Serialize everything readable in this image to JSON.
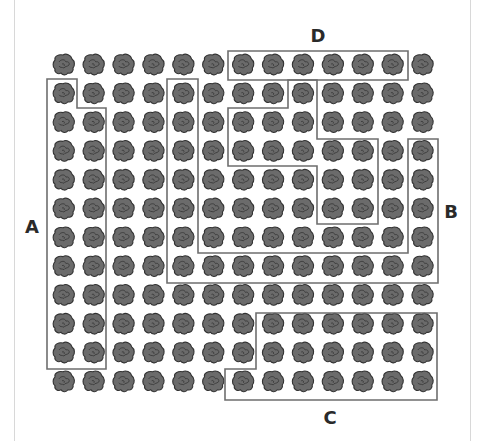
{
  "diagram": {
    "type": "grid-region-diagram",
    "grid": {
      "columns": 13,
      "rows": 12,
      "origin_x": 64,
      "origin_y": 65,
      "col_spacing": 29.9,
      "row_spacing": 28.8,
      "item_icon": "rock-blob-icon",
      "item_fill": "#6b6b6b",
      "item_stroke": "#333333"
    },
    "regions": [
      {
        "id": "A",
        "label": "A",
        "label_pos": [
          32,
          227
        ],
        "points": [
          [
            47,
            79
          ],
          [
            77,
            79
          ],
          [
            77,
            108
          ],
          [
            106,
            108
          ],
          [
            106,
            369
          ],
          [
            47,
            369
          ]
        ]
      },
      {
        "id": "B",
        "label": "B",
        "label_pos": [
          451,
          212
        ],
        "points": [
          [
            167,
            79
          ],
          [
            198,
            79
          ],
          [
            198,
            253
          ],
          [
            408,
            253
          ],
          [
            408,
            139
          ],
          [
            438,
            139
          ],
          [
            438,
            283
          ],
          [
            167,
            283
          ]
        ]
      },
      {
        "id": "C",
        "label": "C",
        "label_pos": [
          330,
          418
        ],
        "points": [
          [
            256,
            313
          ],
          [
            437,
            313
          ],
          [
            437,
            400
          ],
          [
            225,
            400
          ],
          [
            225,
            369
          ],
          [
            256,
            369
          ]
        ]
      },
      {
        "id": "D",
        "label": "D",
        "label_pos": [
          318,
          36
        ],
        "points": [
          [
            228,
            51
          ],
          [
            408,
            51
          ],
          [
            408,
            80
          ],
          [
            228,
            80
          ]
        ]
      },
      {
        "id": "inner",
        "label": "",
        "label_pos": null,
        "points": [
          [
            288,
            80
          ],
          [
            288,
            108
          ],
          [
            228,
            108
          ],
          [
            228,
            166
          ],
          [
            317,
            166
          ],
          [
            317,
            224
          ],
          [
            378,
            224
          ],
          [
            378,
            139
          ],
          [
            317,
            139
          ],
          [
            317,
            80
          ]
        ]
      }
    ],
    "frame": {
      "left_line_x": 14,
      "right_line_x": 470,
      "color": "#d8d8d8"
    },
    "stroke_color": "#6e6e6e"
  }
}
